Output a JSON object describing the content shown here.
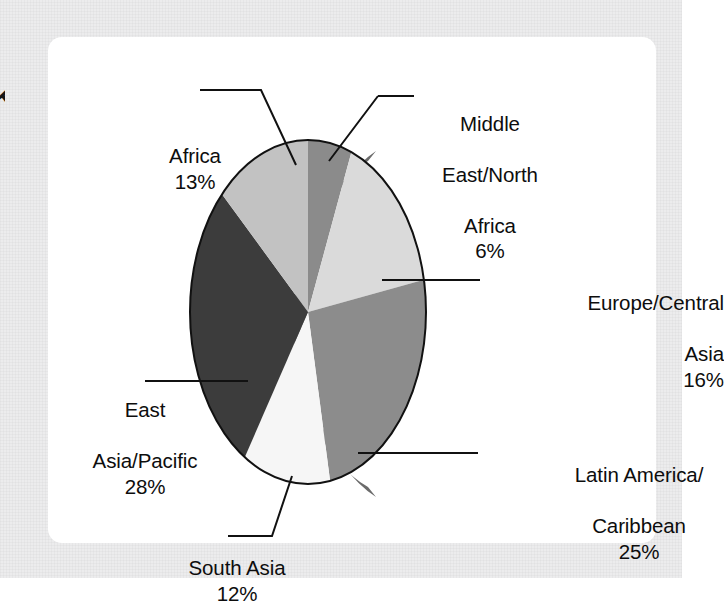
{
  "figure": {
    "clipped_glyph": "K",
    "panel_background": "#ffffff",
    "page_background": "#ececed"
  },
  "chart_data": {
    "type": "pie",
    "title": "",
    "subtitle": "",
    "xlabel": "",
    "ylabel": "",
    "grid": false,
    "legend": "none",
    "labels_with_leader_lines": true,
    "three_d": true,
    "start_angle_deg": 0,
    "direction": "clockwise",
    "total_percent": 100,
    "categories": [
      "Middle East/North Africa",
      "Europe/Central Asia",
      "Latin America/Caribbean",
      "South Asia",
      "East Asia/Pacific",
      "Africa"
    ],
    "values": [
      6,
      16,
      25,
      12,
      28,
      13
    ],
    "slices": [
      {
        "name": "Middle East/North Africa",
        "label_lines": [
          "Middle",
          "East/North",
          "Africa"
        ],
        "value": 6,
        "value_label": "6%",
        "color": "#8b8b8b"
      },
      {
        "name": "Europe/Central Asia",
        "label_lines": [
          "Europe/Central",
          "Asia"
        ],
        "value": 16,
        "value_label": "16%",
        "color": "#dadada"
      },
      {
        "name": "Latin America/Caribbean",
        "label_lines": [
          "Latin America/",
          "Caribbean"
        ],
        "value": 25,
        "value_label": "25%",
        "color": "#8c8c8c"
      },
      {
        "name": "South Asia",
        "label_lines": [
          "South Asia"
        ],
        "value": 12,
        "value_label": "12%",
        "color": "#f6f6f6"
      },
      {
        "name": "East Asia/Pacific",
        "label_lines": [
          "East",
          "Asia/Pacific"
        ],
        "value": 28,
        "value_label": "28%",
        "color": "#3c3c3c"
      },
      {
        "name": "Africa",
        "label_lines": [
          "Africa"
        ],
        "value": 13,
        "value_label": "13%",
        "color": "#c2c2c2"
      }
    ],
    "side_wall_color": "#6b6b6b",
    "outline_color": "#111111"
  },
  "labels": {
    "africa": {
      "name": "Africa",
      "pct": "13%"
    },
    "mena": {
      "line1": "Middle",
      "line2": "East/North",
      "line3": "Africa",
      "pct": "6%"
    },
    "europe": {
      "line1": "Europe/Central",
      "line2": "Asia",
      "pct": "16%"
    },
    "latin": {
      "line1": "Latin America/",
      "line2": "Caribbean",
      "pct": "25%"
    },
    "south_asia": {
      "name": "South Asia",
      "pct": "12%"
    },
    "east_asia": {
      "line1": "East",
      "line2": "Asia/Pacific",
      "pct": "28%"
    }
  }
}
